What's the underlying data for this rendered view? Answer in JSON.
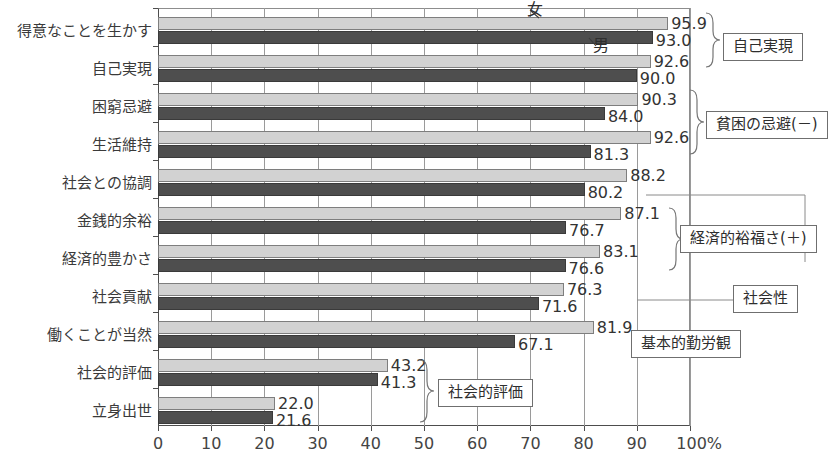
{
  "chart_data": {
    "type": "bar",
    "orientation": "horizontal",
    "title": "",
    "xlabel": "",
    "ylabel": "",
    "xlim": [
      0,
      100
    ],
    "xticks": [
      "0",
      "10",
      "20",
      "30",
      "40",
      "50",
      "60",
      "70",
      "80",
      "90",
      "100%"
    ],
    "grid": true,
    "legend_position": "inline-callout",
    "categories": [
      "得意なことを生かす",
      "自己実現",
      "困窮忌避",
      "生活維持",
      "社会との協調",
      "金銭的余裕",
      "経済的豊かさ",
      "社会貢献",
      "働くことが当然",
      "社会的評価",
      "立身出世"
    ],
    "series": [
      {
        "name": "女",
        "color": "#d2d2d2",
        "values": [
          95.9,
          92.6,
          90.3,
          92.6,
          88.2,
          87.1,
          83.1,
          76.3,
          81.9,
          43.2,
          22.0
        ]
      },
      {
        "name": "男",
        "color": "#4e4e4e",
        "values": [
          93.0,
          90.0,
          84.0,
          81.3,
          80.2,
          76.7,
          76.6,
          71.6,
          67.1,
          41.3,
          21.6
        ]
      }
    ],
    "value_labels": [
      {
        "category": "得意なことを生かす",
        "female": "95.9",
        "male": "93.0"
      },
      {
        "category": "自己実現",
        "female": "92.6",
        "male": "90.0"
      },
      {
        "category": "困窮忌避",
        "female": "90.3",
        "male": "84.0"
      },
      {
        "category": "生活維持",
        "female": "92.6",
        "male": "81.3"
      },
      {
        "category": "社会との協調",
        "female": "88.2",
        "male": "80.2"
      },
      {
        "category": "金銭的余裕",
        "female": "87.1",
        "male": "76.7"
      },
      {
        "category": "経済的豊かさ",
        "female": "83.1",
        "male": "76.6"
      },
      {
        "category": "社会貢献",
        "female": "76.3",
        "male": "71.6"
      },
      {
        "category": "働くことが当然",
        "female": "81.9",
        "male": "67.1"
      },
      {
        "category": "社会的評価",
        "female": "43.2",
        "male": "41.3"
      },
      {
        "category": "立身出世",
        "female": "22.0",
        "male": "21.6"
      }
    ],
    "series_callouts": [
      {
        "label": "女",
        "points_to": "female-bar-row-1"
      },
      {
        "label": "男",
        "points_to": "male-bar-row-1"
      }
    ],
    "group_annotations": [
      {
        "label": "自己実現",
        "covers": [
          "得意なことを生かす",
          "自己実現"
        ]
      },
      {
        "label": "貧困の忌避(－)",
        "covers": [
          "困窮忌避",
          "生活維持"
        ]
      },
      {
        "label": "経済的裕福さ(＋)",
        "covers": [
          "金銭的余裕",
          "経済的豊かさ"
        ]
      },
      {
        "label": "社会性",
        "covers": [
          "社会との協調",
          "社会貢献"
        ]
      },
      {
        "label": "基本的勤労観",
        "covers": [
          "働くことが当然"
        ]
      },
      {
        "label": "社会的評価",
        "covers": [
          "社会的評価",
          "立身出世"
        ]
      }
    ]
  }
}
